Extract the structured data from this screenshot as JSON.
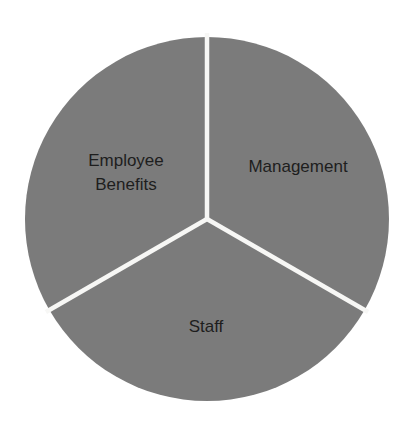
{
  "chart_data": {
    "type": "pie",
    "title": "",
    "categories": [
      "Management",
      "Staff",
      "Employee Benefits"
    ],
    "values": [
      33.33,
      33.33,
      33.33
    ],
    "labels_display": [
      [
        "Management"
      ],
      [
        "Staff"
      ],
      [
        "Employee",
        "Benefits"
      ]
    ],
    "start_angle_deg": 0,
    "direction": "clockwise",
    "legend": "none",
    "labels_inside": true,
    "colors": {
      "slice_fill": "#7b7b7b",
      "separator": "#f7f7f5",
      "label_text": "#1e1e1e",
      "background": "#ffffff"
    }
  },
  "labels": {
    "management": "Management",
    "staff": "Staff",
    "employee_benefits_line1": "Employee",
    "employee_benefits_line2": "Benefits"
  }
}
